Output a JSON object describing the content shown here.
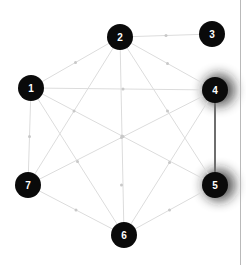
{
  "figure": {
    "title": "",
    "type": "node-link-graph",
    "background_color": "#ffffff",
    "border_color": "#b9b9b9"
  },
  "style": {
    "node_fill": "#0a0a0a",
    "node_radius": 13,
    "node_label_color": "#ffffff",
    "edge_color": "#dcdcdc",
    "edge_width": 1,
    "highlight_edge_color": "#6e6e6e",
    "highlight_edge_width": 2,
    "midpoint_dot_color": "#c8c8c8",
    "glow_color": "#1a1a1a"
  },
  "nodes": [
    {
      "id": "1",
      "label": "1",
      "x": 31,
      "y": 88,
      "highlighted": false
    },
    {
      "id": "2",
      "label": "2",
      "x": 120,
      "y": 37,
      "highlighted": false
    },
    {
      "id": "3",
      "label": "3",
      "x": 212,
      "y": 34,
      "highlighted": false
    },
    {
      "id": "4",
      "label": "4",
      "x": 215,
      "y": 90,
      "highlighted": true
    },
    {
      "id": "5",
      "label": "5",
      "x": 215,
      "y": 185,
      "highlighted": true
    },
    {
      "id": "6",
      "label": "6",
      "x": 124,
      "y": 235,
      "highlighted": false
    },
    {
      "id": "7",
      "label": "7",
      "x": 28,
      "y": 185,
      "highlighted": false
    }
  ],
  "edges": [
    {
      "source": "1",
      "target": "2",
      "highlighted": false
    },
    {
      "source": "1",
      "target": "4",
      "highlighted": false
    },
    {
      "source": "1",
      "target": "5",
      "highlighted": false
    },
    {
      "source": "1",
      "target": "6",
      "highlighted": false
    },
    {
      "source": "1",
      "target": "7",
      "highlighted": false
    },
    {
      "source": "2",
      "target": "3",
      "highlighted": false
    },
    {
      "source": "2",
      "target": "4",
      "highlighted": false
    },
    {
      "source": "2",
      "target": "5",
      "highlighted": false
    },
    {
      "source": "2",
      "target": "6",
      "highlighted": false
    },
    {
      "source": "2",
      "target": "7",
      "highlighted": false
    },
    {
      "source": "4",
      "target": "5",
      "highlighted": true
    },
    {
      "source": "4",
      "target": "6",
      "highlighted": false
    },
    {
      "source": "4",
      "target": "7",
      "highlighted": false
    },
    {
      "source": "5",
      "target": "6",
      "highlighted": false
    },
    {
      "source": "5",
      "target": "7",
      "highlighted": false
    },
    {
      "source": "6",
      "target": "7",
      "highlighted": false
    }
  ],
  "chart_data": {
    "type": "graph",
    "title": "",
    "xlabel": "",
    "ylabel": "",
    "node_count": 7,
    "edge_count": 16,
    "node_ids": [
      "1",
      "2",
      "3",
      "4",
      "5",
      "6",
      "7"
    ],
    "highlighted_nodes": [
      "4",
      "5"
    ],
    "highlighted_edges": [
      [
        "4",
        "5"
      ]
    ],
    "adjacency": {
      "1": [
        "2",
        "4",
        "5",
        "6",
        "7"
      ],
      "2": [
        "1",
        "3",
        "4",
        "5",
        "6",
        "7"
      ],
      "3": [
        "2"
      ],
      "4": [
        "1",
        "2",
        "5",
        "6",
        "7"
      ],
      "5": [
        "1",
        "2",
        "4",
        "6",
        "7"
      ],
      "6": [
        "1",
        "2",
        "4",
        "5",
        "7"
      ],
      "7": [
        "1",
        "2",
        "4",
        "5",
        "6"
      ]
    },
    "legend": [],
    "annotations": []
  }
}
